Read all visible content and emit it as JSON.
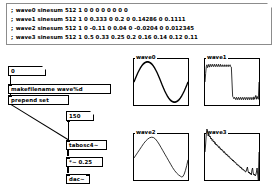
{
  "window": {
    "background": "#ffffff",
    "line_color": "#000000"
  },
  "comment": {
    "lines": [
      {
        "prefix": ";",
        "text": "wave0 sinesum 512 1 0 0 0 0 0 0 0 0"
      },
      {
        "prefix": ";",
        "text": "wave1 sinesum 512 1 0 0.333 0 0.2 0 0.14286 0 0.1111"
      },
      {
        "prefix": ";",
        "text": "wave2 sinesum 512 1 0 -0.11 0 0.04 0 -0.0204 0 0.012345"
      },
      {
        "prefix": ";",
        "text": "wave3 sinesum 512 1 0.5 0.33 0.25 0.2 0.16 0.14 0.12 0.11"
      }
    ]
  },
  "patch": {
    "number_box_index": {
      "value": "0"
    },
    "makefilename": {
      "text": "makefilename wave%d"
    },
    "prepend": {
      "text": "prepend set"
    },
    "number_box_freq": {
      "value": "150"
    },
    "tabosc": {
      "text": "tabosc4~"
    },
    "gain": {
      "text": "*~ 0.25"
    },
    "dac": {
      "text": "dac~"
    }
  },
  "graphs": [
    {
      "label": "wave0",
      "array_name": "wave0",
      "waveform": "sine",
      "points": "0,24 2,20.6 4,17.4 6,14.4 8,11.7 10,9.3 12,7.2 14,5.5 16,4.3 18,3.4 20,3 22,3 24,3.4 26,4.3 28,5.5 30,7.2 32,9.3 34,11.7 36,14.4 38,17.4 40,20.6 42,24 44,27.4 46,30.6 48,33.6 50,36.3 52,38.7 54,40.8 56,42.5 58,43.7 60,44.6 62,45 64,45 66,44.6 68,43.7 70,42.5 72,40.8 74,38.7 76,36.3 78,33.6 80,30.6 82,27.4 84,24"
    },
    {
      "label": "wave1",
      "array_name": "wave1",
      "waveform": "square-with-ripple",
      "points": "0,24 1,15 2,8 3,6 4,9 5,7.5 6,5.5 7,8.5 8,7 9,5.5 10,8 11,7 12,5.5 13,8 14,7 15,5.5 16,8 17,7 18,5.5 19,8 20,7 21,5.5 22,8 23,7 24,5.5 25,8 26,7 27,6 28,8 29,7 30,6 31,8 32,7 33,6 34,8 35,7 36,6 37,8 38,7 39,6 40,8 41,8.5 42,24 43,39 44,40 45,41.5 46,40 47,41 48,42.5 49,40 50,41 51,42.5 52,40 53,41 54,42.5 55,40 56,41 57,42.5 58,40 59,41 60,42.5 61,40 62,41 63,42.5 64,40 65,41 66,42.5 67,40 68,41 69,42.5 70,40 71,41 72,42.5 73,40 74,41 75,42.5 76,39.5 77,42 78,40 79,38 80,42 81,39 82,41 83,42 84,24"
    },
    {
      "label": "wave2",
      "array_name": "wave2",
      "waveform": "triangle",
      "points": "0,25 3,22 6,19 9,16 12,13 15,10 18,7.5 21,5.5 24,4 27,3.4 30,3.6 33,5 36,7.5 39,10.5 42,14 45,17.5 48,21 51,24.5 54,28 57,31.5 60,35 63,38 66,40.5 69,42.5 72,44 74,44.8 76,44.4 78,42 80,38 82,33 84,27"
    },
    {
      "label": "wave3",
      "array_name": "wave3",
      "waveform": "sawtooth",
      "points": "0,24 1,16 2,6 3,1 4,3 5,8 6,6 7,9 8,8 9,11 10,10 11,12.5 12,11.5 13,14 14,13 15,15.5 16,14.5 17,17 18,16 19,18 20,17.5 21,19.5 22,18.5 23,20.5 24,20 25,22 26,21 27,23 28,22.5 29,24.5 30,23.5 31,25.5 32,25 33,27 34,26 35,28 36,27.5 37,29 38,28.5 39,30.5 40,30 41,31.5 42,31 43,33 44,32 45,34 46,33.5 47,35 48,34.5 49,36.5 50,36 51,37.5 52,37 53,38.5 54,38 55,40 56,39 57,41 58,40.5 59,42 60,41.5 61,43 62,42.5 63,44 64,43.5 65,41 66,39 67,43 68,45 69,44 70,46 71,45 72,47 73,42 74,40 75,45 76,47 77,46 78,48 79,47 80,44 81,40 82,46 83,52 84,24"
    }
  ]
}
